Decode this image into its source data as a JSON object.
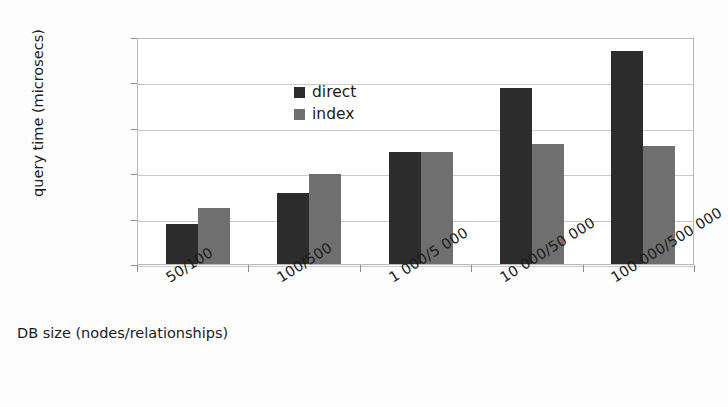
{
  "chart_data": {
    "type": "bar",
    "title": "",
    "xlabel": "DB size (nodes/relationships)",
    "ylabel": "query time (microsecs)",
    "categories": [
      "50/100",
      "100/500",
      "1 000/5 000",
      "10 000/50 000",
      "100 000/500 000"
    ],
    "series": [
      {
        "name": "direct",
        "color": "#2c2c2c",
        "values": [
          7600,
          36000,
          300000,
          7500000,
          50000000
        ]
      },
      {
        "name": "index",
        "color": "#6f6f6f",
        "values": [
          17000,
          97000,
          300000,
          430000,
          400000
        ]
      }
    ],
    "yscale": "log",
    "ylim": [
      1000,
      100000000
    ],
    "ytick_labels": [
      "100 000 000",
      "10 000 000",
      "1 000 000",
      "100 000",
      "10 000",
      "1 000"
    ],
    "ytick_values": [
      100000000,
      10000000,
      1000000,
      100000,
      10000,
      1000
    ],
    "grid": true,
    "legend_position": "top-left"
  },
  "legend": {
    "items": [
      {
        "label": "direct"
      },
      {
        "label": "index"
      }
    ]
  },
  "axes": {
    "y_title": "query time (microsecs)",
    "x_title": "DB size (nodes/relationships)"
  }
}
